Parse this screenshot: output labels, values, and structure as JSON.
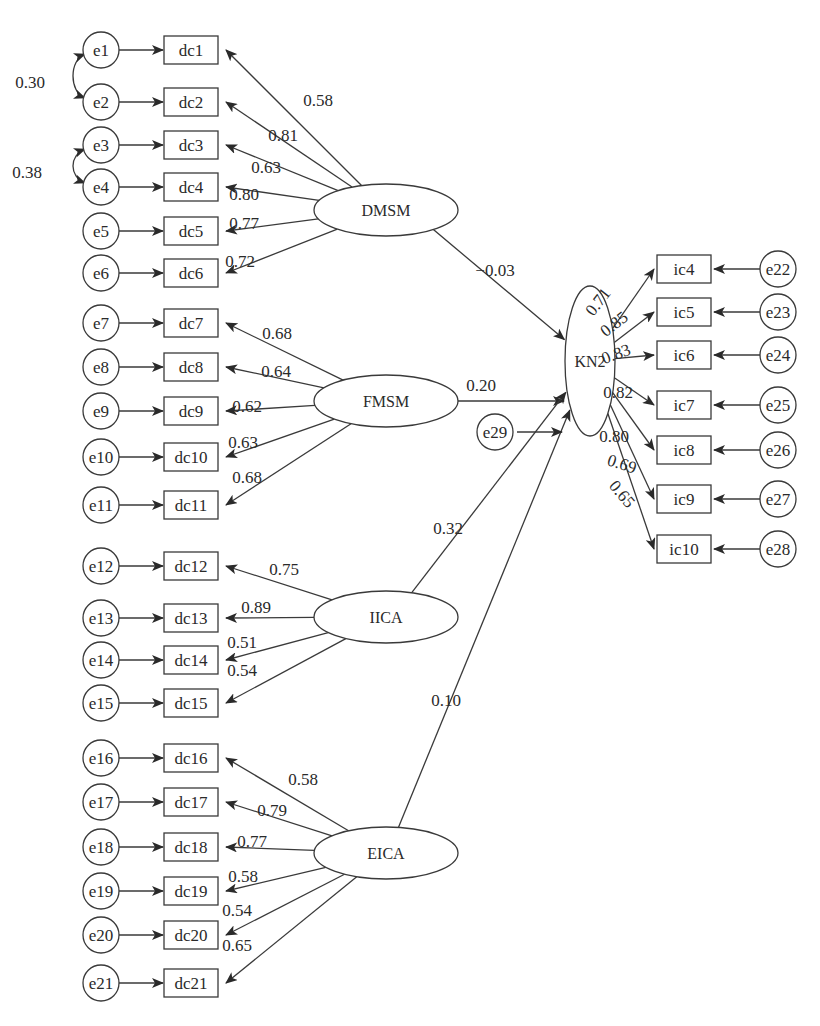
{
  "diagram": {
    "type": "structural-equation-model",
    "latents": [
      {
        "id": "DMSM",
        "label": "DMSM",
        "cx": 386,
        "cy": 210,
        "rx": 72,
        "ry": 26
      },
      {
        "id": "FMSM",
        "label": "FMSM",
        "cx": 386,
        "cy": 401,
        "rx": 72,
        "ry": 26
      },
      {
        "id": "IICA",
        "label": "IICA",
        "cx": 386,
        "cy": 617,
        "rx": 72,
        "ry": 26
      },
      {
        "id": "EICA",
        "label": "EICA",
        "cx": 386,
        "cy": 853,
        "rx": 72,
        "ry": 26
      },
      {
        "id": "KN2",
        "label": "KN2",
        "cx": 590,
        "cy": 361,
        "rx": 25,
        "ry": 75
      }
    ],
    "left_indicators": [
      {
        "error": "e1",
        "item": "dc1",
        "y": 50,
        "factor": "DMSM",
        "loading": "0.58",
        "lx": 318,
        "ly": 100
      },
      {
        "error": "e2",
        "item": "dc2",
        "y": 102,
        "factor": "DMSM",
        "loading": "0.81",
        "lx": 283,
        "ly": 135
      },
      {
        "error": "e3",
        "item": "dc3",
        "y": 145,
        "factor": "DMSM",
        "loading": "0.63",
        "lx": 266,
        "ly": 167
      },
      {
        "error": "e4",
        "item": "dc4",
        "y": 187,
        "factor": "DMSM",
        "loading": "0.80",
        "lx": 244,
        "ly": 194
      },
      {
        "error": "e5",
        "item": "dc5",
        "y": 231,
        "factor": "DMSM",
        "loading": "0.77",
        "lx": 244,
        "ly": 223
      },
      {
        "error": "e6",
        "item": "dc6",
        "y": 273,
        "factor": "DMSM",
        "loading": "0.72",
        "lx": 240,
        "ly": 261
      },
      {
        "error": "e7",
        "item": "dc7",
        "y": 323,
        "factor": "FMSM",
        "loading": "0.68",
        "lx": 277,
        "ly": 333
      },
      {
        "error": "e8",
        "item": "dc8",
        "y": 367,
        "factor": "FMSM",
        "loading": "0.64",
        "lx": 276,
        "ly": 371
      },
      {
        "error": "e9",
        "item": "dc9",
        "y": 411,
        "factor": "FMSM",
        "loading": "0.62",
        "lx": 247,
        "ly": 406
      },
      {
        "error": "e10",
        "item": "dc10",
        "y": 457,
        "factor": "FMSM",
        "loading": "0.63",
        "lx": 243,
        "ly": 442
      },
      {
        "error": "e11",
        "item": "dc11",
        "y": 505,
        "factor": "FMSM",
        "loading": "0.68",
        "lx": 247,
        "ly": 477
      },
      {
        "error": "e12",
        "item": "dc12",
        "y": 566,
        "factor": "IICA",
        "loading": "0.75",
        "lx": 284,
        "ly": 569
      },
      {
        "error": "e13",
        "item": "dc13",
        "y": 618,
        "factor": "IICA",
        "loading": "0.89",
        "lx": 256,
        "ly": 607
      },
      {
        "error": "e14",
        "item": "dc14",
        "y": 660,
        "factor": "IICA",
        "loading": "0.51",
        "lx": 242,
        "ly": 642
      },
      {
        "error": "e15",
        "item": "dc15",
        "y": 703,
        "factor": "IICA",
        "loading": "0.54",
        "lx": 242,
        "ly": 670
      },
      {
        "error": "e16",
        "item": "dc16",
        "y": 758,
        "factor": "EICA",
        "loading": "0.58",
        "lx": 303,
        "ly": 779
      },
      {
        "error": "e17",
        "item": "dc17",
        "y": 802,
        "factor": "EICA",
        "loading": "0.79",
        "lx": 272,
        "ly": 810
      },
      {
        "error": "e18",
        "item": "dc18",
        "y": 847,
        "factor": "EICA",
        "loading": "0.77",
        "lx": 252,
        "ly": 841
      },
      {
        "error": "e19",
        "item": "dc19",
        "y": 891,
        "factor": "EICA",
        "loading": "0.58",
        "lx": 243,
        "ly": 876
      },
      {
        "error": "e20",
        "item": "dc20",
        "y": 935,
        "factor": "EICA",
        "loading": "0.54",
        "lx": 237,
        "ly": 910
      },
      {
        "error": "e21",
        "item": "dc21",
        "y": 983,
        "factor": "EICA",
        "loading": "0.65",
        "lx": 237,
        "ly": 945
      }
    ],
    "right_indicators": [
      {
        "error": "e22",
        "item": "ic4",
        "y": 269,
        "loading": "0.71",
        "lx": 598,
        "ly": 302,
        "rot": -52
      },
      {
        "error": "e23",
        "item": "ic5",
        "y": 312,
        "loading": "0.85",
        "lx": 614,
        "ly": 324,
        "rot": -38
      },
      {
        "error": "e24",
        "item": "ic6",
        "y": 355,
        "loading": "0.83",
        "lx": 616,
        "ly": 354,
        "rot": -20
      },
      {
        "error": "e25",
        "item": "ic7",
        "y": 405,
        "loading": "0.82",
        "lx": 618,
        "ly": 392,
        "rot": 0
      },
      {
        "error": "e26",
        "item": "ic8",
        "y": 450,
        "loading": "0.80",
        "lx": 614,
        "ly": 436,
        "rot": 0
      },
      {
        "error": "e27",
        "item": "ic9",
        "y": 499,
        "loading": "0.69",
        "lx": 622,
        "ly": 464,
        "rot": 18
      },
      {
        "error": "e28",
        "item": "ic10",
        "y": 549,
        "loading": "0.65",
        "lx": 622,
        "ly": 494,
        "rot": 50
      }
    ],
    "structural_paths": [
      {
        "from": "DMSM",
        "to": "KN2",
        "coef": "−0.03",
        "lx": 495,
        "ly": 270
      },
      {
        "from": "FMSM",
        "to": "KN2",
        "coef": "0.20",
        "lx": 481,
        "ly": 385
      },
      {
        "from": "IICA",
        "to": "KN2",
        "coef": "0.32",
        "lx": 448,
        "ly": 528
      },
      {
        "from": "EICA",
        "to": "KN2",
        "coef": "0.10",
        "lx": 446,
        "ly": 700
      }
    ],
    "disturbance": {
      "error": "e29",
      "target": "KN2",
      "cx": 495,
      "cy": 432
    },
    "covariances": [
      {
        "a": "e1",
        "b": "e2",
        "value": "0.30",
        "lx": 30,
        "ly": 82
      },
      {
        "a": "e3",
        "b": "e4",
        "value": "0.38",
        "lx": 27,
        "ly": 172
      }
    ]
  }
}
